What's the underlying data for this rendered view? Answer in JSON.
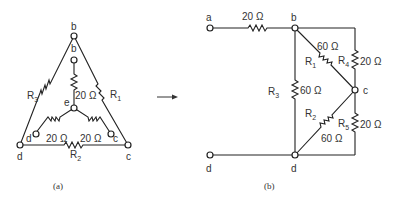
{
  "figure_a": {
    "caption": "(a)",
    "nodes": {
      "b_outer": "b",
      "b_inner": "b",
      "e": "e",
      "d_outer": "d",
      "d_inner": "d",
      "c_outer": "c",
      "c_inner": "c"
    },
    "resistors": {
      "R1": {
        "name": "R",
        "sub": "1"
      },
      "R2": {
        "name": "R",
        "sub": "2"
      },
      "R3": {
        "name": "R",
        "sub": "3"
      },
      "eb": "20 Ω",
      "ed": "20 Ω",
      "ec": "20 Ω"
    }
  },
  "arrow": "→",
  "figure_b": {
    "caption": "(b)",
    "nodes": {
      "a": "a",
      "b": "b",
      "c": "c",
      "d_left": "d",
      "d_right": "d"
    },
    "resistors": {
      "ab": "20 Ω",
      "R1": {
        "name": "R",
        "sub": "1",
        "value": "60 Ω"
      },
      "R2": {
        "name": "R",
        "sub": "2",
        "value": "60 Ω"
      },
      "R3": {
        "name": "R",
        "sub": "3",
        "value": "60 Ω"
      },
      "R4": {
        "name": "R",
        "sub": "4",
        "value": "20 Ω"
      },
      "R5": {
        "name": "R",
        "sub": "5",
        "value": "20 Ω"
      }
    }
  }
}
